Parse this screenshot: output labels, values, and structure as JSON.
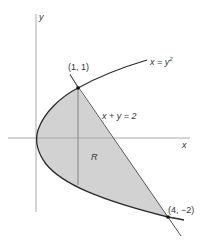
{
  "figure": {
    "axes": {
      "x_label": "x",
      "y_label": "y"
    },
    "curves": {
      "parabola_label": "x = y",
      "parabola_exponent": "2",
      "line_label": "x + y = 2"
    },
    "points": {
      "upper": "(1, 1)",
      "lower": "(4, −2)"
    },
    "region_label": "R",
    "colors": {
      "fill": "#d2d2d2",
      "curve": "#2a2a2a",
      "axis": "#a8a8a8"
    }
  }
}
